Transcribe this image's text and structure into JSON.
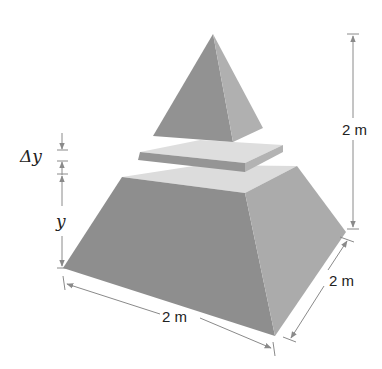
{
  "diagram": {
    "labels": {
      "height": "2 m",
      "base_front_width": "2 m",
      "base_side_depth": "2 m",
      "slab_thickness": "Δy",
      "slab_height": "y"
    },
    "colors": {
      "face_dark": "#8c8c8c",
      "face_mid": "#a6a6a6",
      "face_light": "#d2d2d2",
      "top_light": "#e0e0e0",
      "dimension_line": "#8a8a8a",
      "text": "#222222"
    },
    "components": [
      {
        "name": "top-pyramid",
        "description": "Pyramid above the slab"
      },
      {
        "name": "slab",
        "description": "Thin horizontal slice of thickness Δy"
      },
      {
        "name": "frustum",
        "description": "Lower truncated pyramid of height y"
      }
    ]
  }
}
